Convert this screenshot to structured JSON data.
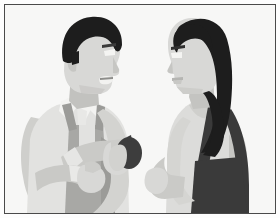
{
  "image": {
    "title": "Two people talking",
    "caption": "A man in overalls holding a dark round object speaks with a long-haired woman carrying a shoulder bag",
    "style": "flat vector illustration, grayscale",
    "width": 280,
    "height": 218,
    "background_color": "#f7f7f6",
    "border_color": "#4a4a4a",
    "page_color": "#fdfdfd"
  },
  "palette": {
    "background": "#f7f7f6",
    "hair_dark": "#1d1d1d",
    "skin_light": "#d8d8d6",
    "skin_shadow": "#c2c2bf",
    "shirt_white": "#efefed",
    "overalls_gray": "#a8a8a5",
    "overalls_dark": "#9b9b98",
    "sleeve_gray": "#c9c9c6",
    "dress_light": "#dcdcda",
    "dress_shadow": "#c6c6c3",
    "bag_dark": "#3a3a3a",
    "object_dark": "#3d3d3d",
    "outline": "#4a4a4a"
  },
  "figures": [
    {
      "id": "man",
      "data_name": "figure-man",
      "label": "Man",
      "position": "left",
      "facing": "right",
      "hair": "short dark hair, receding hairline",
      "expression": "smiling, mouth open speaking",
      "clothing": "light collared shirt with gray overalls and shoulder straps",
      "holding": "dark round object in raised right hand",
      "parts": [
        {
          "name": "head",
          "data_name": "man-head"
        },
        {
          "name": "hair",
          "data_name": "man-hair"
        },
        {
          "name": "eye",
          "data_name": "man-eye"
        },
        {
          "name": "nose",
          "data_name": "man-nose"
        },
        {
          "name": "mouth",
          "data_name": "man-mouth"
        },
        {
          "name": "ear",
          "data_name": "man-ear"
        },
        {
          "name": "neck",
          "data_name": "man-neck"
        },
        {
          "name": "collar",
          "data_name": "man-collar"
        },
        {
          "name": "torso",
          "data_name": "man-torso"
        },
        {
          "name": "overalls",
          "data_name": "man-overalls"
        },
        {
          "name": "left-arm",
          "data_name": "man-left-arm"
        },
        {
          "name": "right-arm",
          "data_name": "man-right-arm"
        },
        {
          "name": "left-hand",
          "data_name": "man-left-hand"
        },
        {
          "name": "right-hand",
          "data_name": "man-right-hand"
        },
        {
          "name": "held-object",
          "data_name": "man-held-object"
        }
      ]
    },
    {
      "id": "woman",
      "data_name": "figure-woman",
      "label": "Woman",
      "position": "right",
      "facing": "left",
      "hair": "long dark hair past the shoulders",
      "expression": "calm, listening",
      "clothing": "light sleeveless top with dark shoulder bag strap",
      "holding": "shoulder bag at hip",
      "parts": [
        {
          "name": "head",
          "data_name": "woman-head"
        },
        {
          "name": "hair",
          "data_name": "woman-hair"
        },
        {
          "name": "eyebrow",
          "data_name": "woman-eyebrow"
        },
        {
          "name": "eye",
          "data_name": "woman-eye"
        },
        {
          "name": "nose",
          "data_name": "woman-nose"
        },
        {
          "name": "lips",
          "data_name": "woman-lips"
        },
        {
          "name": "neck",
          "data_name": "woman-neck"
        },
        {
          "name": "torso",
          "data_name": "woman-torso"
        },
        {
          "name": "arm",
          "data_name": "woman-arm"
        },
        {
          "name": "hand",
          "data_name": "woman-hand"
        },
        {
          "name": "bag-strap",
          "data_name": "woman-bag-strap"
        },
        {
          "name": "bag",
          "data_name": "woman-bag"
        }
      ]
    }
  ]
}
